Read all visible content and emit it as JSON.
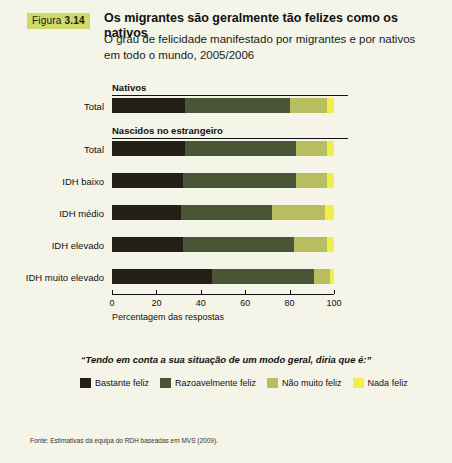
{
  "figure": {
    "word": "Figura",
    "number": "3.14"
  },
  "header": {
    "title": "Os migrantes são geralmente tão felizes como os nativos",
    "subtitle": "O grau de felicidade manifestado por migrantes e por nativos em todo o mundo, 2005/2006"
  },
  "legend_question": "“Tendo em conta a sua situação de um modo geral, diria que é:”",
  "source": "Fonte: Estimativas da equipa do RDH baseadas em MVS (2009).",
  "chart_data": {
    "type": "bar",
    "orientation": "horizontal",
    "stacked": true,
    "title": "Os migrantes são geralmente tão felizes como os nativos",
    "subtitle": "O grau de felicidade manifestado por migrantes e por nativos em todo o mundo, 2005/2006",
    "xlabel": "Percentagem das respostas",
    "ylabel": "",
    "xlim": [
      0,
      105
    ],
    "xticks": [
      0,
      20,
      40,
      60,
      80,
      100
    ],
    "grid": false,
    "legend_position": "bottom",
    "groups": [
      {
        "name": "Nativos",
        "categories": [
          "Total"
        ]
      },
      {
        "name": "Nascidos no estrangeiro",
        "categories": [
          "Total",
          "IDH baixo",
          "IDH médio",
          "IDH elevado",
          "IDH muito elevado"
        ]
      }
    ],
    "categories": [
      "Total",
      "Total",
      "IDH baixo",
      "IDH médio",
      "IDH elevado",
      "IDH muito elevado"
    ],
    "series": [
      {
        "name": "Bastante feliz",
        "color": "#231f17",
        "values": [
          33,
          33,
          32,
          31,
          32,
          45
        ]
      },
      {
        "name": "Razoavelmente feliz",
        "color": "#4a5535",
        "values": [
          47,
          50,
          51,
          41,
          50,
          46
        ]
      },
      {
        "name": "Não muito feliz",
        "color": "#b8bd5f",
        "values": [
          17,
          14,
          14,
          24,
          15,
          7
        ]
      },
      {
        "name": "Nada feliz",
        "color": "#f2ef4a",
        "values": [
          3,
          3,
          3,
          4,
          3,
          2
        ]
      }
    ]
  }
}
